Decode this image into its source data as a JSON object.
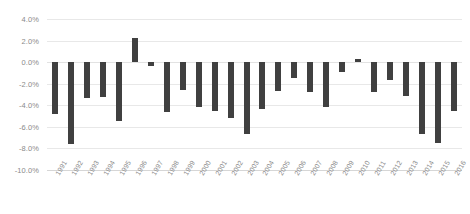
{
  "chart_data": {
    "type": "bar",
    "title": "",
    "subtitle": "",
    "xlabel": "",
    "ylabel": "",
    "ylim": [
      -10.0,
      4.0
    ],
    "y_ticks": [
      4.0,
      2.0,
      0.0,
      -2.0,
      -4.0,
      -6.0,
      -8.0,
      -10.0
    ],
    "y_tick_labels": [
      "4.0%",
      "2.0%",
      "0.0%",
      "-2.0%",
      "-4.0%",
      "-6.0%",
      "-8.0%",
      "-10.0%"
    ],
    "grid": true,
    "grid_axis": "y",
    "legend": false,
    "legend_position": "none",
    "bar_color": "#404040",
    "grid_color": "#e8e8e8",
    "axis_label_color": "#8a8a8a",
    "x_tick_rotation": -60,
    "categories": [
      "1991",
      "1992",
      "1993",
      "1994",
      "1995",
      "1996",
      "1997",
      "1998",
      "1999",
      "2000",
      "2001",
      "2002",
      "2003",
      "2004",
      "2005",
      "2006",
      "2007",
      "2008",
      "2009",
      "2010",
      "2011",
      "2012",
      "2013",
      "2014",
      "2015",
      "2016"
    ],
    "values": [
      -4.8,
      -7.6,
      -3.3,
      -3.2,
      -5.5,
      2.2,
      -0.4,
      -4.6,
      -2.6,
      -4.2,
      -4.5,
      -5.2,
      -6.7,
      -4.3,
      -2.7,
      -1.5,
      -2.8,
      -4.2,
      -0.9,
      0.3,
      -2.8,
      -1.7,
      -3.1,
      -6.7,
      -7.5,
      -4.5
    ],
    "value_unit": "%",
    "series": [
      {
        "name": "Annual change",
        "values": [
          -4.8,
          -7.6,
          -3.3,
          -3.2,
          -5.5,
          2.2,
          -0.4,
          -4.6,
          -2.6,
          -4.2,
          -4.5,
          -5.2,
          -6.7,
          -4.3,
          -2.7,
          -1.5,
          -2.8,
          -4.2,
          -0.9,
          0.3,
          -2.8,
          -1.7,
          -3.1,
          -6.7,
          -7.5,
          -4.5
        ]
      }
    ]
  }
}
